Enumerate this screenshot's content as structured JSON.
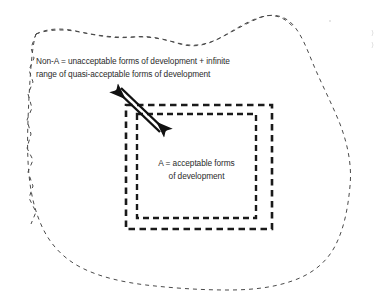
{
  "diagram": {
    "type": "concept-diagram",
    "background_color": "#ffffff",
    "ink_color": "#2b2b2b",
    "outer_region": {
      "name": "non-acceptable-region",
      "shape": "irregular-blob",
      "border_style": "dashed",
      "label_lines": [
        "Non-A = unacceptable forms of development + infinite",
        "range of quasi-acceptable forms of development"
      ]
    },
    "outer_box": {
      "name": "quasi-acceptable-boundary-box",
      "shape": "rectangle",
      "border_style": "dashed-thick",
      "x": 126,
      "y": 105,
      "width": 146,
      "height": 124
    },
    "inner_box": {
      "name": "acceptable-boundary-box",
      "shape": "rectangle",
      "border_style": "dashed-thick",
      "x": 137,
      "y": 114,
      "width": 119,
      "height": 104,
      "label_lines": [
        "A = acceptable forms",
        "of development"
      ]
    },
    "arrows": [
      {
        "name": "arrow-outward",
        "direction": "up-left",
        "from": [
          160,
          131
        ],
        "to": [
          113,
          88
        ]
      },
      {
        "name": "arrow-inward",
        "direction": "down-right",
        "from": [
          117,
          88
        ],
        "to": [
          165,
          131
        ]
      }
    ]
  }
}
